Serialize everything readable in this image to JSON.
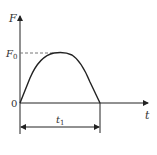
{
  "diagram": {
    "type": "force-time pulse curve",
    "y_axis_label": "F",
    "x_axis_label": "t",
    "origin_label": "0",
    "peak_label": "F",
    "peak_subscript": "0",
    "duration_label": "t",
    "duration_subscript": "1",
    "colors": {
      "line": "#222222",
      "dashed": "#777777",
      "text": "#333333"
    }
  }
}
